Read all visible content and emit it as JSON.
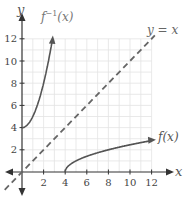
{
  "chart_data": {
    "type": "line",
    "title": "",
    "xlabel": "x",
    "ylabel": "y",
    "xlim": [
      -2,
      13
    ],
    "ylim": [
      -3,
      13
    ],
    "grid": true,
    "x_ticks": [
      2,
      4,
      6,
      8,
      10,
      12
    ],
    "y_ticks": [
      2,
      4,
      6,
      8,
      10,
      12
    ],
    "series": [
      {
        "name": "f^{-1}(x)",
        "label": "f",
        "label_sup": "−1",
        "label_tail": "(x)",
        "expression": "x^2 + 4, x >= 0",
        "x": [
          0,
          0.5,
          1,
          1.5,
          2,
          2.5,
          2.83
        ],
        "y": [
          4,
          4.25,
          5,
          6.25,
          8,
          10.25,
          12
        ],
        "style": "solid",
        "color": "#555555"
      },
      {
        "name": "f(x)",
        "label": "f(x)",
        "expression": "sqrt(x - 4), x >= 4",
        "x": [
          4,
          4.25,
          5,
          6.25,
          8,
          10.25,
          12
        ],
        "y": [
          0,
          0.5,
          1,
          1.5,
          2,
          2.5,
          2.83
        ],
        "style": "solid",
        "color": "#555555"
      },
      {
        "name": "y = x",
        "label": "y = x",
        "expression": "x",
        "x": [
          -2,
          12.3
        ],
        "y": [
          -2,
          12.3
        ],
        "style": "dashed",
        "color": "#666666"
      }
    ],
    "colors": {
      "axis": "#333333",
      "grid": "#e3e3e3",
      "curve": "#555555",
      "text": "#555555"
    }
  }
}
